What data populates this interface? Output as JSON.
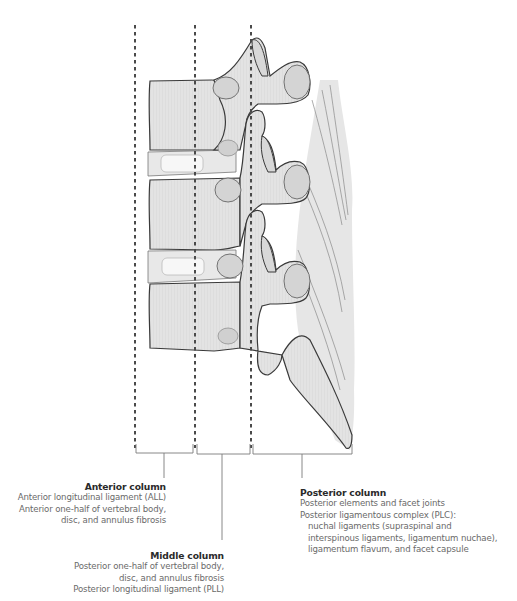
{
  "figure": {
    "columns": [
      {
        "id": "anterior",
        "title": "Anterior column",
        "lines": [
          "Anterior longitudinal ligament (ALL)",
          "Anterior one-half of vertebral body,",
          "disc, and annulus fibrosis"
        ]
      },
      {
        "id": "middle",
        "title": "Middle column",
        "lines": [
          "Posterior one-half of vertebral body,",
          "disc, and annulus fibrosis",
          "Posterior longitudinal ligament (PLL)"
        ]
      },
      {
        "id": "posterior",
        "title": "Posterior column",
        "lines": [
          "Posterior elements and facet joints",
          "Posterior ligamentous complex (PLC):",
          "nuchal ligaments (supraspinal and",
          "interspinous ligaments, ligamentum nuchae),",
          "ligamentum flavum, and facet capsule"
        ]
      }
    ],
    "colors": {
      "bone_fill": "#e2e2e2",
      "bone_outline": "#3a3a3a",
      "disc_fill": "#f4f4f4",
      "dashed_line": "#4a4a4a",
      "bracket": "#7a7a7a",
      "title_text": "#2a2a2a",
      "body_text": "#6a6a6a"
    }
  }
}
